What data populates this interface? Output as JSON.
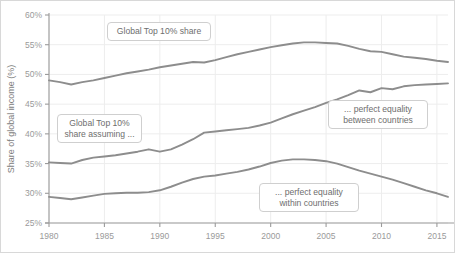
{
  "chart_data": {
    "type": "line",
    "title": "",
    "xlabel": "",
    "ylabel": "Share of global income (%)",
    "xlim": [
      1980,
      2016
    ],
    "ylim": [
      25,
      60
    ],
    "grid": true,
    "legend_position": "inline-annotations",
    "xticks": [
      1980,
      1985,
      1990,
      1995,
      2000,
      2005,
      2010,
      2015
    ],
    "xtick_labels": [
      "1980",
      "1985",
      "1990",
      "1995",
      "2000",
      "2005",
      "2010",
      "2015"
    ],
    "yticks": [
      25,
      30,
      35,
      40,
      45,
      50,
      55,
      60
    ],
    "ytick_labels": [
      "25%",
      "30%",
      "35%",
      "40%",
      "45%",
      "50%",
      "55%",
      "60%"
    ],
    "line_color": "#8d8d8d",
    "grid_color": "#ededed",
    "axis_color": "#9b9b9b",
    "x": [
      1980,
      1981,
      1982,
      1983,
      1984,
      1985,
      1986,
      1987,
      1988,
      1989,
      1990,
      1991,
      1992,
      1993,
      1994,
      1995,
      1996,
      1997,
      1998,
      1999,
      2000,
      2001,
      2002,
      2003,
      2004,
      2005,
      2006,
      2007,
      2008,
      2009,
      2010,
      2011,
      2012,
      2013,
      2014,
      2015,
      2016
    ],
    "series": [
      {
        "name": "Global Top 10% share",
        "values": [
          49.0,
          48.7,
          48.3,
          48.7,
          49.0,
          49.4,
          49.8,
          50.2,
          50.5,
          50.8,
          51.2,
          51.5,
          51.8,
          52.1,
          52.0,
          52.4,
          52.9,
          53.4,
          53.8,
          54.2,
          54.6,
          54.9,
          55.2,
          55.4,
          55.4,
          55.3,
          55.2,
          54.8,
          54.3,
          53.9,
          53.8,
          53.4,
          53.0,
          52.8,
          52.6,
          52.3,
          52.1
        ]
      },
      {
        "name": "Global Top 10% share assuming perfect equality between countries",
        "values": [
          35.2,
          35.1,
          35.0,
          35.6,
          36.0,
          36.2,
          36.4,
          36.7,
          37.0,
          37.4,
          37.0,
          37.4,
          38.2,
          39.1,
          40.2,
          40.4,
          40.6,
          40.8,
          41.0,
          41.4,
          41.9,
          42.6,
          43.3,
          43.9,
          44.5,
          45.2,
          45.8,
          46.5,
          47.3,
          47.0,
          47.7,
          47.5,
          48.0,
          48.2,
          48.3,
          48.4,
          48.5
        ]
      },
      {
        "name": "Global Top 10% share assuming perfect equality within countries",
        "values": [
          29.4,
          29.2,
          29.0,
          29.3,
          29.6,
          29.9,
          30.0,
          30.1,
          30.1,
          30.2,
          30.5,
          31.1,
          31.8,
          32.4,
          32.8,
          33.0,
          33.3,
          33.6,
          34.0,
          34.5,
          35.1,
          35.5,
          35.7,
          35.7,
          35.6,
          35.4,
          35.0,
          34.4,
          33.8,
          33.3,
          32.8,
          32.3,
          31.7,
          31.1,
          30.5,
          30.0,
          29.4
        ]
      }
    ]
  },
  "annotations": [
    {
      "id": "top10-share",
      "text": "Global Top 10% share"
    },
    {
      "id": "top10-share-assuming",
      "text": "Global Top 10%\nshare assuming ..."
    },
    {
      "id": "equality-between",
      "text": "... perfect equality\nbetween countries"
    },
    {
      "id": "equality-within",
      "text": "... perfect equality\nwithin countries"
    }
  ]
}
